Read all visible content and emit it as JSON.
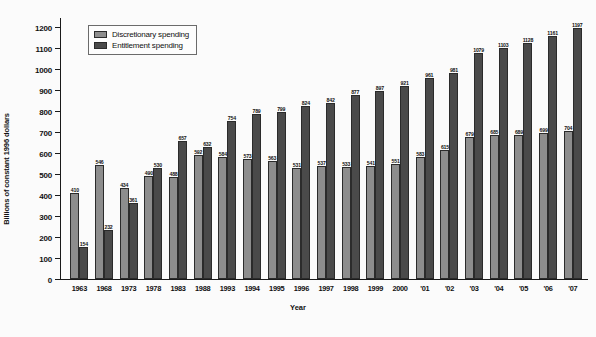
{
  "chart_data": {
    "type": "bar",
    "title": "",
    "xlabel": "Year",
    "ylabel": "Billions of constant 1996 dollars",
    "ylim": [
      0,
      1250
    ],
    "yticks": [
      0,
      100,
      200,
      300,
      400,
      500,
      600,
      700,
      800,
      900,
      1000,
      1100,
      1200
    ],
    "grid": false,
    "legend_position": "top-left",
    "categories": [
      "1963",
      "1968",
      "1973",
      "1978",
      "1983",
      "1988",
      "1993",
      "1994",
      "1995",
      "1996",
      "1997",
      "1998",
      "1999",
      "2000",
      "'01",
      "'02",
      "'03",
      "'04",
      "'05",
      "'06",
      "'07"
    ],
    "series": [
      {
        "name": "Discretionary spending",
        "color": "#8d8d8d",
        "values": [
          410,
          546,
          434,
          490,
          488,
          592,
          584,
          573,
          563,
          531,
          537,
          533,
          541,
          551,
          583,
          615,
          679,
          685,
          689,
          699,
          704
        ]
      },
      {
        "name": "Entitlement spending",
        "color": "#4a4a4a",
        "values": [
          154,
          232,
          361,
          530,
          657,
          632,
          754,
          789,
          799,
          824,
          842,
          877,
          897,
          921,
          961,
          981,
          1079,
          1103,
          1128,
          1161,
          1197
        ]
      }
    ]
  },
  "legend": {
    "items": [
      {
        "label": "Discretionary spending",
        "swatch": "disc"
      },
      {
        "label": "Entitlement spending",
        "swatch": "ent"
      }
    ]
  }
}
